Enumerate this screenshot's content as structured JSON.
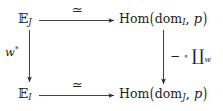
{
  "figure": {
    "kind": "commutative-diagram",
    "background_color": "#ffffff",
    "ink_color": "#222222"
  },
  "nodes": {
    "top_left": {
      "full_text": "E_J",
      "base": "ᴇ",
      "base_display": "𝔼",
      "subscript": "J"
    },
    "top_right": {
      "full_text": "Hom(dom_I, p)",
      "operator": "Hom",
      "open_paren": "(",
      "argument_base": "dom",
      "argument_subscript": "I",
      "separator": ",",
      "second_argument": "p",
      "close_paren": ")"
    },
    "bottom_left": {
      "full_text": "E_I",
      "base_display": "𝔼",
      "subscript": "I"
    },
    "bottom_right": {
      "full_text": "Hom(dom_J, p)",
      "operator": "Hom",
      "open_paren": "(",
      "argument_base": "dom",
      "argument_subscript": "J",
      "separator": ",",
      "second_argument": "p",
      "close_paren": ")"
    }
  },
  "arrows": {
    "top": {
      "direction": "right",
      "label": "≃",
      "label_name": "simeq"
    },
    "bottom": {
      "direction": "right",
      "label": "≃",
      "label_name": "simeq"
    },
    "left": {
      "direction": "down",
      "label_base": "w",
      "label_superscript": "*",
      "label_full": "w*"
    },
    "right": {
      "direction": "down",
      "label_dash": "−",
      "label_circ": "∘",
      "label_coproduct": "∐",
      "label_subscript": "w",
      "label_full": "− ∘ ∐_w"
    }
  }
}
